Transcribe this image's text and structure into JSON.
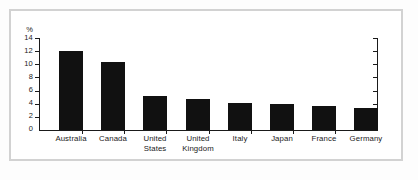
{
  "chart_data": {
    "type": "bar",
    "title": "",
    "subtitle": "",
    "xlabel": "",
    "ylabel": "%",
    "yunit": "%",
    "ylim": [
      0,
      14
    ],
    "ytick_step": 2,
    "grid": false,
    "legend": null,
    "bar_color": "#111111",
    "axis_color": "#1a1a1a",
    "categories": [
      "Australia",
      "Canada",
      "United States",
      "United Kingdom",
      "Italy",
      "Japan",
      "France",
      "Germany"
    ],
    "category_lines": [
      [
        "Australia",
        ""
      ],
      [
        "Canada",
        ""
      ],
      [
        "United",
        "States"
      ],
      [
        "United",
        "Kingdom"
      ],
      [
        "Italy",
        ""
      ],
      [
        "Japan",
        ""
      ],
      [
        "France",
        ""
      ],
      [
        "Germany",
        ""
      ]
    ],
    "values": [
      12.0,
      10.4,
      5.2,
      4.7,
      4.1,
      4.0,
      3.7,
      3.3
    ],
    "ytick_labels": [
      "14",
      "12",
      "10",
      "8",
      "6",
      "4",
      "2",
      "0"
    ],
    "ytick_values": [
      14,
      12,
      10,
      8,
      6,
      4,
      2,
      0
    ]
  }
}
